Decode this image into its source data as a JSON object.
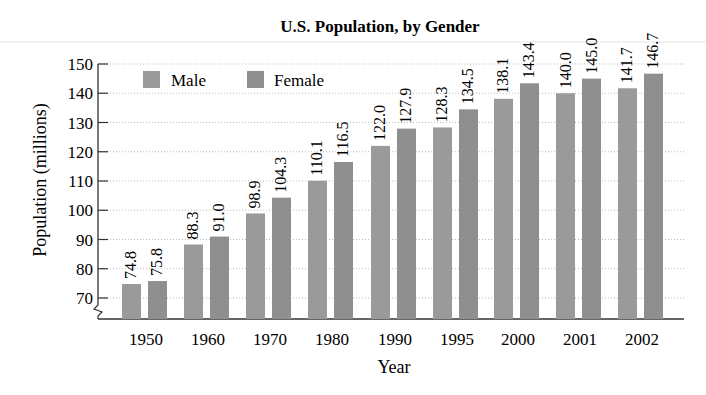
{
  "chart_data": {
    "type": "bar",
    "title": "U.S. Population, by Gender",
    "xlabel": "Year",
    "ylabel": "Population (millions)",
    "categories": [
      "1950",
      "1960",
      "1970",
      "1980",
      "1990",
      "1995",
      "2000",
      "2001",
      "2002"
    ],
    "series": [
      {
        "name": "Male",
        "values": [
          74.8,
          88.3,
          98.9,
          110.1,
          122.0,
          128.3,
          138.1,
          140.0,
          141.7
        ],
        "color": "#9a9a9a"
      },
      {
        "name": "Female",
        "values": [
          75.8,
          91.0,
          104.3,
          116.5,
          127.9,
          134.5,
          143.4,
          145.0,
          146.7
        ],
        "color": "#8f8f8f"
      }
    ],
    "yticks": [
      70,
      80,
      90,
      100,
      110,
      120,
      130,
      140,
      150
    ],
    "ylim": [
      65,
      150
    ],
    "axis_break": true,
    "grid": "dotted horizontal",
    "legend_position": "top-left inside",
    "data_labels": "rotated vertical above bars"
  }
}
